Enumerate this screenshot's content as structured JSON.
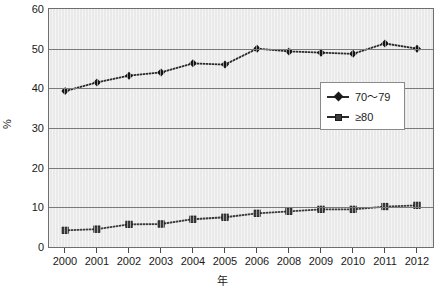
{
  "chart_data": {
    "type": "line",
    "title": "",
    "xlabel": "年",
    "ylabel": "%",
    "categories": [
      "2000",
      "2001",
      "2002",
      "2003",
      "2004",
      "2005",
      "2006",
      "2008",
      "2009",
      "2010",
      "2011",
      "2012"
    ],
    "ylim": [
      0,
      60
    ],
    "yticks": [
      0,
      10,
      20,
      30,
      40,
      50,
      60
    ],
    "grid": true,
    "legend_position": "center-right",
    "series": [
      {
        "name": "70～79",
        "marker": "diamond",
        "color": "#2b2b2b",
        "values": [
          39.3,
          41.5,
          43.2,
          44.0,
          46.3,
          46.0,
          50.0,
          49.3,
          49.0,
          48.7,
          51.3,
          50.0
        ]
      },
      {
        "name": "≥80",
        "marker": "square",
        "color": "#3a3a3a",
        "values": [
          4.2,
          4.5,
          5.7,
          5.8,
          7.0,
          7.5,
          8.5,
          9.0,
          9.5,
          9.5,
          10.2,
          10.5
        ]
      }
    ]
  },
  "axis": {
    "y_tick_labels": [
      "60",
      "50",
      "40",
      "30",
      "20",
      "10",
      "0"
    ],
    "y_title": "%",
    "x_title": "年"
  },
  "legend": {
    "items": [
      {
        "label": "70～79"
      },
      {
        "label": "≥80"
      }
    ]
  },
  "colors": {
    "plot_background": "#e9e9e9",
    "gridline": "#7a7a7a",
    "frame": "#6e6e6e",
    "series_1": "#2b2b2b",
    "series_2": "#3a3a3a",
    "text": "#1a1a1a"
  }
}
